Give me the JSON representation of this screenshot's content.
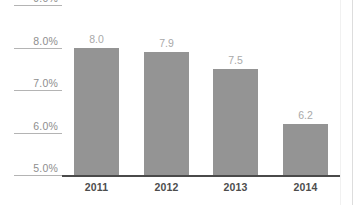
{
  "chart_data": {
    "type": "bar",
    "title": "",
    "subtitle": "",
    "xlabel": "",
    "ylabel": "",
    "categories": [
      "2011",
      "2012",
      "2013",
      "2014"
    ],
    "values": [
      8.0,
      7.9,
      7.5,
      6.2
    ],
    "value_labels": [
      "8.0",
      "7.9",
      "7.5",
      "6.2"
    ],
    "ylim": [
      5.0,
      9.0
    ],
    "ytick_values": [
      9.0,
      8.0,
      7.0,
      6.0,
      5.0
    ],
    "ytick_labels": [
      "9.0%",
      "8.0%",
      "7.0%",
      "6.0%",
      "5.0%"
    ],
    "grid": false,
    "legend": false,
    "legend_position": "none",
    "bar_color": "#949494",
    "axis_color": "#4a4a4a",
    "tick_rule_color": "#b4b4b4",
    "value_label_color": "#a9a9a9",
    "category_label_color": "#4d4d4d",
    "ytick_label_color": "#8e8e8e",
    "background_color": "#ffffff"
  }
}
